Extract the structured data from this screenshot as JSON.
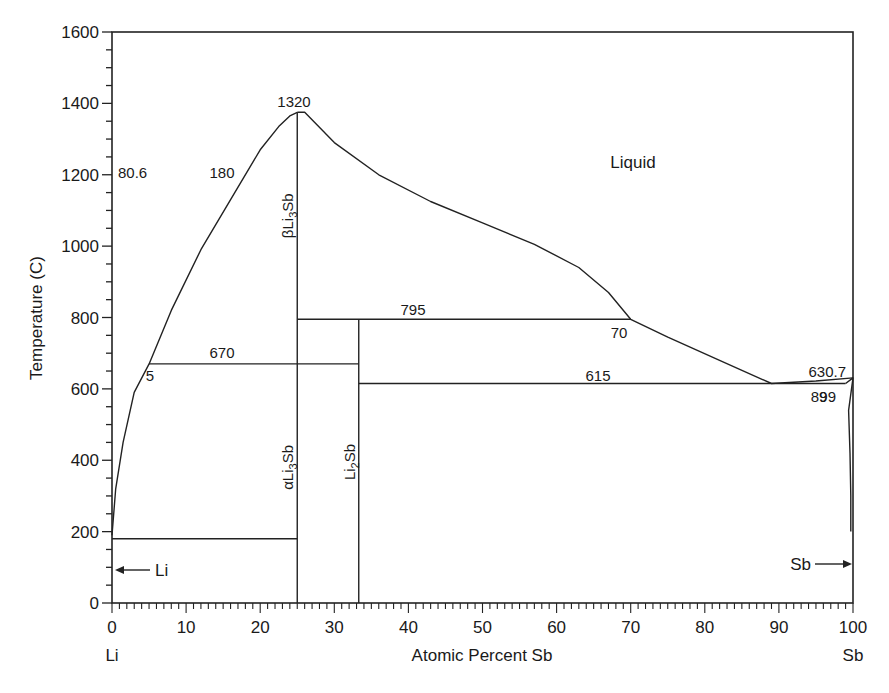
{
  "chart_data": {
    "type": "phase_diagram",
    "title": "",
    "xlabel": "Atomic Percent Sb",
    "ylabel": "Temperature (C)",
    "xlim": [
      0,
      100
    ],
    "ylim": [
      0,
      1600
    ],
    "x_ticks": [
      0,
      10,
      20,
      30,
      40,
      50,
      60,
      70,
      80,
      90,
      100
    ],
    "y_ticks": [
      0,
      200,
      400,
      600,
      800,
      1000,
      1200,
      1400,
      1600
    ],
    "x_end_labels": {
      "left": "Li",
      "right": "Sb"
    },
    "grid": false,
    "legend": null,
    "regions": [
      {
        "label": "Liquid",
        "x": 70,
        "y": 1285
      }
    ],
    "phases": [
      {
        "label": "βLi3Sb",
        "base": "βLi",
        "sub": "3",
        "tail": "Sb",
        "composition": 25,
        "t_range": [
          800,
          1375
        ]
      },
      {
        "label": "αLi3Sb",
        "base": "αLi",
        "sub": "3",
        "tail": "Sb",
        "composition": 25,
        "t_range": [
          0,
          670
        ]
      },
      {
        "label": "Li2Sb",
        "base": "Li",
        "sub": "2",
        "tail": "Sb",
        "composition": 33.3,
        "t_range": [
          0,
          795
        ]
      }
    ],
    "invariant_lines": [
      {
        "temperature": 180,
        "x_range": [
          0,
          25
        ],
        "label": "180"
      },
      {
        "temperature": 670,
        "x_range": [
          5,
          33.3
        ],
        "label": "670"
      },
      {
        "temperature": 795,
        "x_range": [
          25,
          70
        ],
        "label": "795"
      },
      {
        "temperature": 615,
        "x_range": [
          33.3,
          99
        ],
        "label": "615"
      }
    ],
    "liquidus": [
      {
        "name": "Li-side liquidus",
        "points": [
          [
            0,
            190
          ],
          [
            0.5,
            320
          ],
          [
            1.5,
            450
          ],
          [
            3,
            590
          ],
          [
            5,
            670
          ],
          [
            8,
            820
          ],
          [
            12,
            990
          ],
          [
            16,
            1130
          ],
          [
            20,
            1270
          ],
          [
            22.5,
            1335
          ],
          [
            24,
            1365
          ],
          [
            25,
            1375
          ]
        ]
      },
      {
        "name": "Sb-side liquidus",
        "points": [
          [
            25,
            1375
          ],
          [
            26,
            1375
          ],
          [
            30,
            1290
          ],
          [
            36,
            1200
          ],
          [
            43,
            1125
          ],
          [
            50,
            1065
          ],
          [
            57,
            1005
          ],
          [
            63,
            940
          ],
          [
            67,
            870
          ],
          [
            70,
            795
          ],
          [
            75,
            745
          ],
          [
            82,
            680
          ],
          [
            89,
            615
          ],
          [
            95,
            622
          ],
          [
            100,
            630.7
          ]
        ]
      },
      {
        "name": "Sb solvus",
        "points": [
          [
            99,
            615
          ],
          [
            100,
            630.7
          ],
          [
            99.4,
            540
          ],
          [
            99.6,
            420
          ],
          [
            99.7,
            300
          ],
          [
            99.7,
            200
          ]
        ]
      }
    ],
    "annotations": [
      {
        "text": "1320",
        "x": 25,
        "y": 1390,
        "meaning": "congruent melting point of Li3Sb"
      },
      {
        "text": "670",
        "x": 15,
        "y": 685
      },
      {
        "text": "5",
        "x": 5,
        "y": 640
      },
      {
        "text": "795",
        "x": 40,
        "y": 810
      },
      {
        "text": "70",
        "x": 69,
        "y": 755
      },
      {
        "text": "615",
        "x": 60,
        "y": 630
      },
      {
        "text": "89",
        "x": 89,
        "y": 575
      },
      {
        "text": "630.7",
        "x": 96,
        "y": 645
      },
      {
        "text": "99",
        "x": 97.5,
        "y": 575
      },
      {
        "text": "80.6",
        "x": 2.5,
        "y": 200
      },
      {
        "text": "180",
        "x": 13,
        "y": 200
      },
      {
        "text": "Li",
        "x": 3,
        "y": 90,
        "note": "arrow pointing left to Li melting point"
      },
      {
        "text": "Sb",
        "x": 96.5,
        "y": 90,
        "note": "arrow pointing right to Sb"
      }
    ],
    "labels": {
      "liquid": "Liquid",
      "t1320": "1320",
      "t670": "670",
      "c5": "5",
      "t795": "795",
      "c70": "70",
      "t615": "615",
      "c89": "89",
      "t630": "630.7",
      "c99": "99",
      "c80": "80.6",
      "t180": "180",
      "li_arrow": "Li",
      "sb_arrow": "Sb"
    }
  }
}
